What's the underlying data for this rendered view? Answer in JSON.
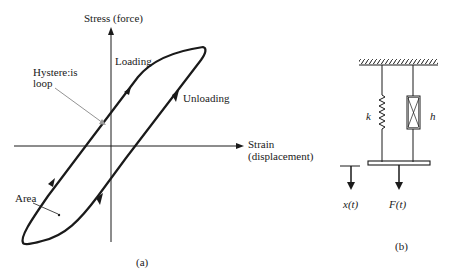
{
  "figure_a": {
    "caption": "(a)",
    "y_axis_label": "Stress (force)",
    "x_axis_label_line1": "Strain",
    "x_axis_label_line2": "(displacement)",
    "loading_label": "Loading",
    "unloading_label": "Unloading",
    "hysteresis_label_line1": "Hystere:is",
    "hysteresis_label_line2": "loop",
    "area_label": "Area"
  },
  "figure_b": {
    "caption": "(b)",
    "spring_label": "k",
    "damper_label": "h",
    "displacement_label": "x(t)",
    "force_label": "F(t)"
  },
  "colors": {
    "ink": "#1a1a1a",
    "pointer": "#777777",
    "background": "#ffffff"
  }
}
